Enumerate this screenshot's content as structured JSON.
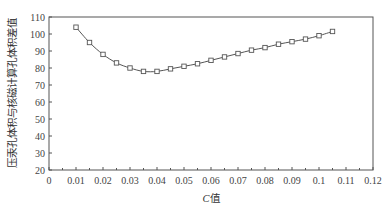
{
  "chart_data": {
    "type": "line",
    "title": "",
    "xlabel": "C值",
    "xlabel_italic_part": "C",
    "xlabel_rest": "值",
    "ylabel": "压汞孔体积与核磁计算孔体积差值",
    "xlim": [
      0,
      0.12
    ],
    "ylim": [
      20,
      110
    ],
    "x_ticks": [
      "0",
      "0.01",
      "0.02",
      "0.03",
      "0.04",
      "0.05",
      "0.06",
      "0.07",
      "0.08",
      "0.09",
      "0.1",
      "0.11",
      "0.12"
    ],
    "y_ticks": [
      "20",
      "30",
      "40",
      "50",
      "60",
      "70",
      "80",
      "90",
      "100",
      "110"
    ],
    "grid": false,
    "legend": null,
    "marker": "open-square",
    "series": [
      {
        "name": "差值",
        "x": [
          0.01,
          0.015,
          0.02,
          0.025,
          0.03,
          0.035,
          0.04,
          0.045,
          0.05,
          0.055,
          0.06,
          0.065,
          0.07,
          0.075,
          0.08,
          0.085,
          0.09,
          0.095,
          0.1,
          0.105
        ],
        "values": [
          104,
          95,
          88,
          83,
          80,
          78,
          78,
          79.5,
          81,
          82.5,
          84.5,
          86.5,
          88.5,
          90.5,
          92,
          94,
          95.5,
          97,
          99,
          101.5
        ]
      }
    ]
  },
  "colors": {
    "line": "#555555",
    "axis": "#555555",
    "marker_fill": "#ffffff"
  }
}
